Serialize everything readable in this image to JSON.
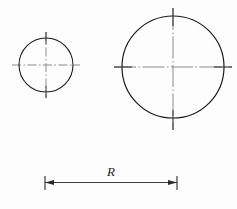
{
  "drawing": {
    "title": "Two concentric-crosshair circles with radial dimension",
    "background_color": "#fdfdfd",
    "outline_color": "#1a1a1a",
    "centerline_color": "#8a8a8a",
    "dimension_color": "#2a2a2a",
    "shapes": [
      {
        "name": "small-circle",
        "type": "circle",
        "cx": 46,
        "cy": 65,
        "r": 27,
        "stroke_width": 1.1
      },
      {
        "name": "large-circle",
        "type": "circle",
        "cx": 173,
        "cy": 67,
        "r": 51,
        "stroke_width": 1.2
      }
    ],
    "centerlines": [
      {
        "name": "small-circle-horizontal-centerline",
        "orientation": "horizontal",
        "x1": 12,
        "y1": 65,
        "x2": 80,
        "y2": 65
      },
      {
        "name": "small-circle-vertical-centerline",
        "orientation": "vertical",
        "x1": 46,
        "y1": 32,
        "x2": 46,
        "y2": 98
      },
      {
        "name": "large-circle-horizontal-centerline",
        "orientation": "horizontal",
        "x1": 114,
        "y1": 67,
        "x2": 232,
        "y2": 67
      },
      {
        "name": "large-circle-vertical-centerline",
        "orientation": "vertical",
        "x1": 173,
        "y1": 8,
        "x2": 173,
        "y2": 130
      }
    ],
    "dimension": {
      "label": "R",
      "label_x": 111,
      "label_y": 176,
      "line_y": 182,
      "x_start": 45,
      "x_end": 177,
      "extension_tick_top": 176,
      "extension_tick_bottom": 190,
      "arrow_length": 8,
      "arrow_half_width": 2.6
    }
  }
}
